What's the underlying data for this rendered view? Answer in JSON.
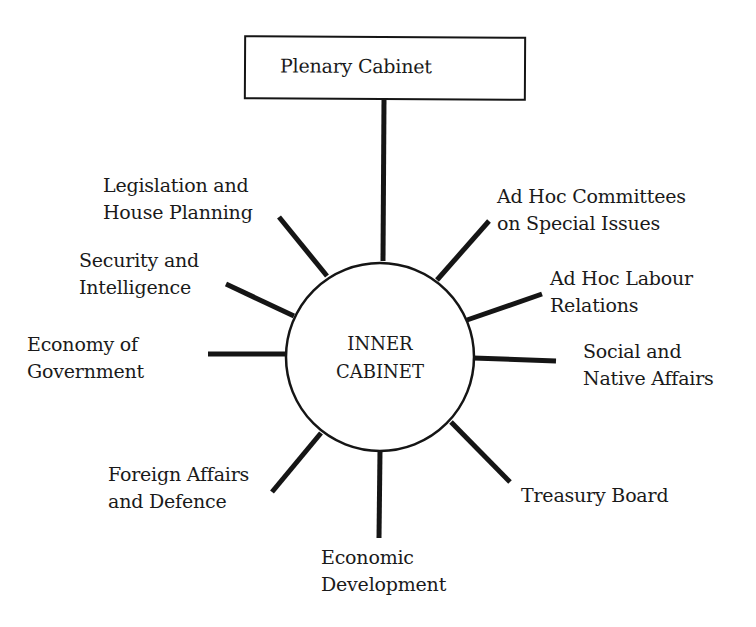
{
  "diagram": {
    "top_node": {
      "label": "Plenary Cabinet"
    },
    "center_node": {
      "line1": "INNER",
      "line2": "CABINET"
    },
    "committees": [
      {
        "id": "legislation",
        "line1": "Legislation and",
        "line2": "House Planning"
      },
      {
        "id": "security",
        "line1": "Security and",
        "line2": "Intelligence"
      },
      {
        "id": "economy-govt",
        "line1": "Economy of",
        "line2": "Government"
      },
      {
        "id": "foreign",
        "line1": "Foreign Affairs",
        "line2": "and Defence"
      },
      {
        "id": "economic-dev",
        "line1": "Economic",
        "line2": "Development"
      },
      {
        "id": "treasury",
        "line1": "Treasury Board",
        "line2": ""
      },
      {
        "id": "social-native",
        "line1": "Social and",
        "line2": "Native Affairs"
      },
      {
        "id": "labour",
        "line1": "Ad Hoc Labour",
        "line2": "Relations"
      },
      {
        "id": "adhoc-special",
        "line1": "Ad Hoc Committees",
        "line2": "on Special Issues"
      }
    ],
    "colors": {
      "ink": "#151515",
      "background": "#ffffff"
    }
  }
}
